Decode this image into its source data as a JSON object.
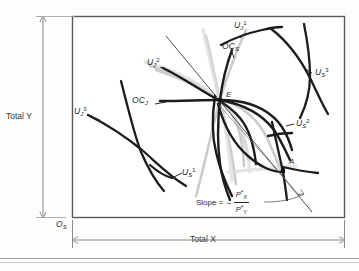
{
  "figure": {
    "type": "edgeworth-box-diagram",
    "title": "",
    "box": {
      "left": 72,
      "top": 16,
      "right": 345,
      "bottom": 218
    },
    "axes": {
      "y_label": "Total Y",
      "x_label": "Total X",
      "origin_label": "O",
      "origin_sub": "S"
    },
    "points": [
      {
        "name": "E",
        "label": "E",
        "x": 220,
        "y": 100
      },
      {
        "name": "A",
        "label": "A",
        "x": 283,
        "y": 167
      }
    ],
    "curve_labels": [
      {
        "name": "uj1",
        "base": "U",
        "sub": "J",
        "sup": "1",
        "x": 238,
        "y": 26
      },
      {
        "name": "ocs",
        "base": "OC",
        "sub": "S",
        "sup": "",
        "x": 229,
        "y": 47
      },
      {
        "name": "us3",
        "base": "U",
        "sub": "S",
        "sup": "3",
        "x": 317,
        "y": 72
      },
      {
        "name": "uj2",
        "base": "U",
        "sub": "J",
        "sup": "2",
        "x": 152,
        "y": 63
      },
      {
        "name": "ocj",
        "base": "OC",
        "sub": "J",
        "sup": "",
        "x": 140,
        "y": 100
      },
      {
        "name": "us2",
        "base": "U",
        "sub": "S",
        "sup": "2",
        "x": 296,
        "y": 124
      },
      {
        "name": "uj3",
        "base": "U",
        "sub": "J",
        "sup": "3",
        "x": 78,
        "y": 112
      },
      {
        "name": "us1",
        "base": "U",
        "sub": "S",
        "sup": "1",
        "x": 176,
        "y": 172
      }
    ],
    "slope_note": {
      "text": "Slope =",
      "minus": "−",
      "numerator": "P",
      "numerator_sub": "X",
      "denominator": "P",
      "denominator_sub": "Y",
      "star": "*"
    },
    "colors": {
      "curve": "#1c1c1c",
      "frame": "#5a5a5a",
      "axis": "#8a8a8a",
      "text": "#2b2b2b",
      "ghost": "#b9b9b9"
    }
  }
}
